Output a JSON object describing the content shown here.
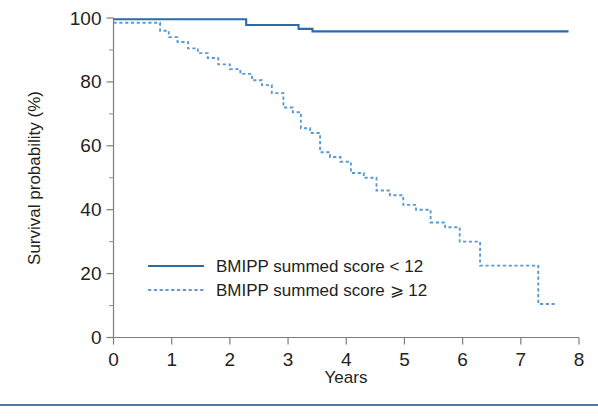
{
  "figure": {
    "background_color": "#ffffff",
    "footer_rule": {
      "color": "#4a7ba7",
      "y": 404,
      "thickness": 2
    }
  },
  "colors": {
    "series_solid": "#2b6ca8",
    "series_dashed": "#5b9bd5",
    "axis": "#7d7d7d",
    "axis_minor": "#9a9a9a",
    "text": "#231f20"
  },
  "chart_data": {
    "type": "line",
    "title": "",
    "subtitle": "",
    "xlabel": "Years",
    "ylabel": "Survival probability (%)",
    "xlim": [
      0,
      8
    ],
    "ylim": [
      0,
      100
    ],
    "xticks": [
      0,
      1,
      2,
      3,
      4,
      5,
      6,
      7,
      8
    ],
    "xtick_labels": [
      "0",
      "1",
      "2",
      "3",
      "4",
      "5",
      "6",
      "7",
      "8"
    ],
    "yticks": [
      0,
      20,
      40,
      60,
      80,
      100
    ],
    "ytick_labels": [
      "0",
      "20",
      "40",
      "60",
      "80",
      "100"
    ],
    "yticks_minor": [
      10,
      30,
      50,
      70,
      90
    ],
    "grid": false,
    "legend_position": "lower-left-inside",
    "series": [
      {
        "name": "BMIPP summed score < 12",
        "style": "solid",
        "color": "#2b6ca8",
        "x": [
          0.0,
          2.28,
          2.28,
          3.18,
          3.18,
          3.42,
          3.42,
          7.82
        ],
        "y": [
          99.6,
          99.6,
          97.8,
          97.8,
          96.6,
          96.6,
          95.8,
          95.8
        ]
      },
      {
        "name": "BMIPP summed score ⩾ 12",
        "style": "dashed",
        "color": "#5b9bd5",
        "x": [
          0.0,
          0.8,
          0.8,
          0.95,
          0.95,
          1.1,
          1.1,
          1.28,
          1.28,
          1.45,
          1.45,
          1.62,
          1.62,
          1.8,
          1.8,
          2.0,
          2.0,
          2.18,
          2.18,
          2.38,
          2.38,
          2.55,
          2.55,
          2.72,
          2.72,
          2.92,
          2.92,
          3.08,
          3.08,
          3.22,
          3.22,
          3.38,
          3.38,
          3.55,
          3.55,
          3.72,
          3.72,
          3.9,
          3.9,
          4.08,
          4.08,
          4.3,
          4.3,
          4.52,
          4.52,
          4.75,
          4.75,
          4.98,
          4.98,
          5.2,
          5.2,
          5.45,
          5.45,
          5.7,
          5.7,
          5.95,
          5.95,
          6.3,
          6.3,
          7.3,
          7.3,
          7.62
        ],
        "y": [
          98.5,
          98.5,
          96.0,
          96.0,
          94.0,
          94.0,
          92.5,
          92.5,
          90.5,
          90.5,
          89.0,
          89.0,
          87.5,
          87.5,
          85.5,
          85.5,
          84.0,
          84.0,
          82.5,
          82.5,
          80.5,
          80.5,
          79.0,
          79.0,
          76.5,
          76.5,
          72.0,
          72.0,
          70.5,
          70.5,
          65.5,
          65.5,
          64.0,
          64.0,
          58.0,
          58.0,
          56.5,
          56.5,
          55.0,
          55.0,
          51.5,
          51.5,
          50.0,
          50.0,
          46.0,
          46.0,
          44.5,
          44.5,
          41.5,
          41.5,
          40.0,
          40.0,
          36.0,
          36.0,
          34.5,
          34.5,
          30.0,
          30.0,
          22.5,
          22.5,
          10.5,
          10.5
        ]
      }
    ],
    "legend": [
      {
        "label": "BMIPP summed score < 12",
        "style": "solid",
        "color": "#2b6ca8"
      },
      {
        "label": "BMIPP summed score ⩾ 12",
        "style": "dashed",
        "color": "#5b9bd5"
      }
    ]
  }
}
